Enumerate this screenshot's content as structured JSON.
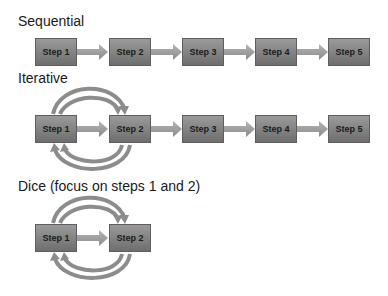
{
  "sections": [
    {
      "title": "Sequential",
      "steps": [
        "Step 1",
        "Step 2",
        "Step 3",
        "Step 4",
        "Step 5"
      ]
    },
    {
      "title": "Iterative",
      "steps": [
        "Step 1",
        "Step 2",
        "Step 3",
        "Step 4",
        "Step 5"
      ]
    },
    {
      "title": "Dice (focus on steps 1 and 2)",
      "steps": [
        "Step 1",
        "Step 2"
      ]
    }
  ],
  "colors": {
    "box_top": "#9a9a9a",
    "box_bottom": "#6e6e6e",
    "arrow": "#a0a0a0",
    "loop_arrow": "#8c8c8c"
  }
}
